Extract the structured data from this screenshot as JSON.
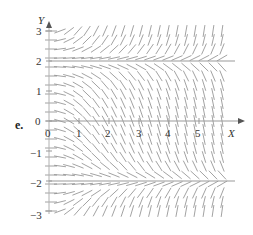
{
  "figure": {
    "part_label": "e.",
    "x_axis_label": "X",
    "y_axis_label": "Y",
    "x_ticks": [
      "0",
      "1",
      "2",
      "3",
      "4",
      "5"
    ],
    "y_ticks": [
      "3",
      "2",
      "1",
      "0",
      "−1",
      "−2",
      "−3"
    ]
  },
  "slope_field": {
    "equation_form": "dy/dx = x(y-2)(y+2)/k",
    "equilibria": [
      2,
      -2
    ],
    "x_range": [
      0,
      6
    ],
    "y_range": [
      -3,
      3
    ],
    "line_color": "#8a8a8a",
    "axis_color": "#999999"
  }
}
